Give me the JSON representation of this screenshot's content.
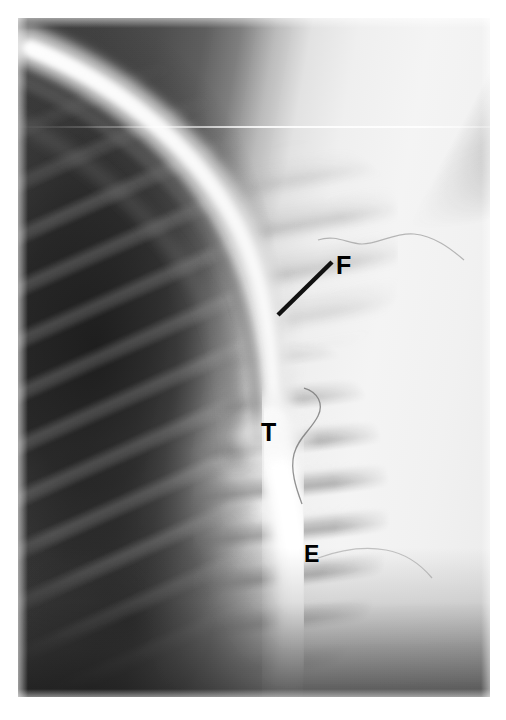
{
  "figure": {
    "kind": "radiograph",
    "modality": "lateral chest / cervicothoracic radiograph with contrast",
    "background_color": "#ffffff",
    "plate": {
      "left": 18,
      "top": 18,
      "width": 472,
      "height": 679
    }
  },
  "annotations": {
    "labels": [
      {
        "id": "F",
        "text": "F",
        "name": "annotation-label-f",
        "x": 336,
        "y": 253,
        "font_size": 25,
        "color": "#000000",
        "has_leader_line": true
      },
      {
        "id": "T",
        "text": "T",
        "name": "annotation-label-t",
        "x": 261,
        "y": 420,
        "font_size": 25,
        "color": "#000000",
        "has_leader_line": false
      },
      {
        "id": "E",
        "text": "E",
        "name": "annotation-label-e",
        "x": 304,
        "y": 543,
        "font_size": 23,
        "color": "#000000",
        "has_leader_line": false
      }
    ],
    "leader_lines": [
      {
        "id": "F-leader",
        "name": "leader-line-f",
        "x1": 278,
        "y1": 315,
        "x2": 332,
        "y2": 262,
        "stroke": "#111111",
        "stroke_width": 4.5
      }
    ]
  },
  "anatomy": {
    "structures": [
      {
        "name": "tracheal-air-column",
        "description": "bright curved band sweeping from upper left toward centre",
        "color": "#f4f4f4"
      },
      {
        "name": "esophageal-contrast-column",
        "description": "bright vertical column in lower centre",
        "color": "#f6f6f6"
      },
      {
        "name": "vertebral-bodies",
        "description": "horizontally striped column right of centre",
        "color": "#8a8a8a"
      },
      {
        "name": "left-lung-field",
        "description": "dark radiolucent field on the left",
        "color": "#2a2a2a"
      },
      {
        "name": "shoulder-scapula-band",
        "description": "dark diagonal band in upper right",
        "color": "#3c3c3c"
      },
      {
        "name": "catheter-wire",
        "description": "thin curvilinear opaque wire near mid-field",
        "color": "#5a5a5a"
      }
    ]
  },
  "palette": {
    "film_white": "#f4f4f4",
    "film_mid": "#9a9a9a",
    "film_dark": "#2c2c2c",
    "annotation_black": "#000000",
    "page_background": "#ffffff"
  }
}
